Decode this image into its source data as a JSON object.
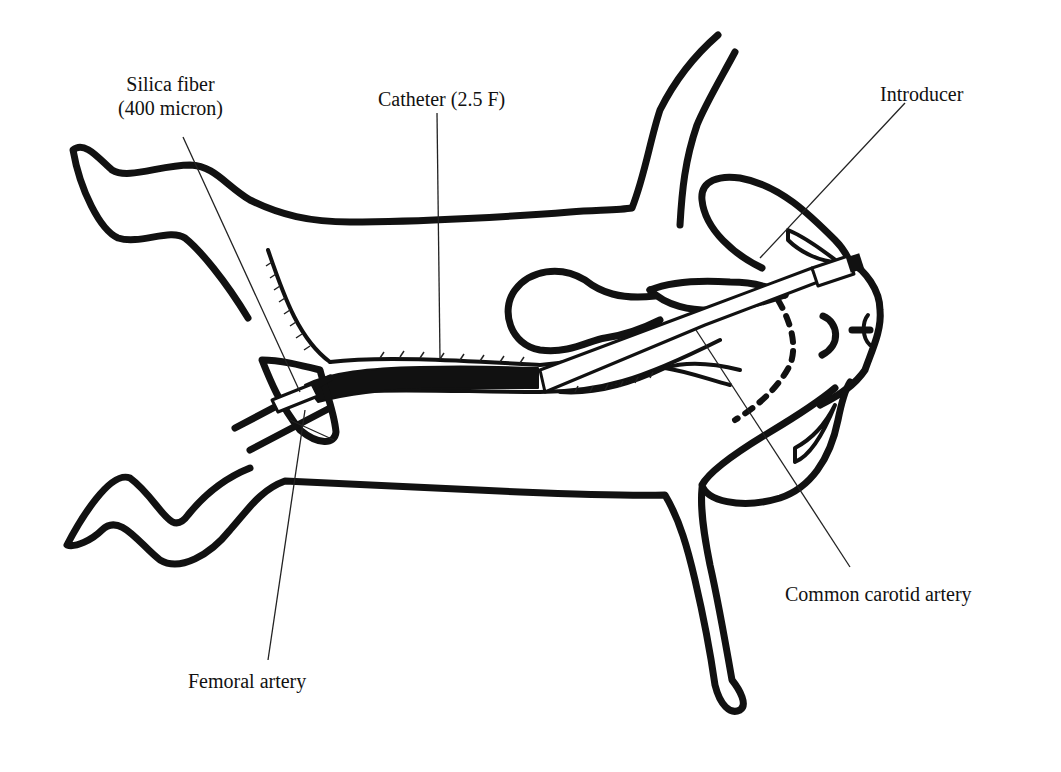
{
  "figure": {
    "colors": {
      "line": "#111111",
      "background": "#ffffff"
    }
  },
  "labels": {
    "silica_fiber": {
      "line1": "Silica fiber",
      "line2": "(400 micron)"
    },
    "catheter": "Catheter (2.5 F)",
    "introducer": "Introducer",
    "common_carotid_artery": "Common carotid artery",
    "femoral_artery": "Femoral artery"
  }
}
